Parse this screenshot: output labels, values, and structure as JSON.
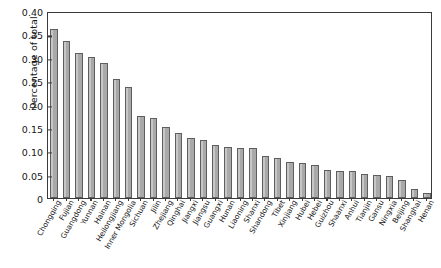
{
  "chart_data": {
    "type": "bar",
    "title": "",
    "xlabel": "",
    "ylabel": "Percentage of total",
    "ylim": [
      0,
      0.4
    ],
    "yticks": [
      0,
      0.05,
      0.1,
      0.15,
      0.2,
      0.25,
      0.3,
      0.35,
      0.4
    ],
    "ytick_labels": [
      "0",
      "0.05",
      "0.10",
      "0.15",
      "0.20",
      "0.25",
      "0.30",
      "0.35",
      "0.40"
    ],
    "grid": false,
    "legend": null,
    "bar_color": "#a9a9a9",
    "bar_edge_color": "#5e5e5e",
    "categories": [
      "Chongqing",
      "Fujian",
      "Guangdong",
      "Yunnan",
      "Hainan",
      "Heilongjiang",
      "Inner Mongolia",
      "Sichuan",
      "Jilin",
      "Zhejiang",
      "Qinghai",
      "Jiangxi",
      "Jiangsu",
      "Guangxi",
      "Hunan",
      "Liaoning",
      "Shanxi",
      "Shandong",
      "Tibet",
      "Xinjiang",
      "Hubei",
      "Hebei",
      "Guizhou",
      "Shaanxi",
      "Anhui",
      "Tianjin",
      "Gansu",
      "Ningxia",
      "Beijing",
      "Shanghai",
      "Henan"
    ],
    "values": [
      0.362,
      0.335,
      0.311,
      0.302,
      0.288,
      0.255,
      0.237,
      0.175,
      0.172,
      0.152,
      0.14,
      0.129,
      0.124,
      0.113,
      0.11,
      0.108,
      0.108,
      0.09,
      0.085,
      0.078,
      0.074,
      0.07,
      0.06,
      0.058,
      0.057,
      0.052,
      0.05,
      0.048,
      0.038,
      0.02,
      0.01
    ]
  }
}
